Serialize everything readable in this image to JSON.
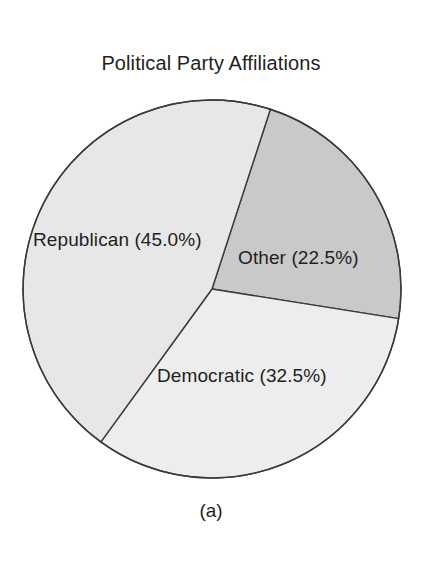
{
  "chart_data": {
    "type": "pie",
    "title": "Political Party Affiliations",
    "caption": "(a)",
    "xlabel": "",
    "ylabel": "",
    "legend": "none",
    "grid": false,
    "start_angle_deg": 72,
    "direction": "clockwise",
    "categories": [
      "Other",
      "Democratic",
      "Republican"
    ],
    "values": [
      22.5,
      32.5,
      45.0
    ],
    "units": "percent",
    "slices": [
      {
        "name": "Other",
        "value": 22.5,
        "label": "Other (22.5%)",
        "color": "#c9c9c9",
        "angle_deg": 81.0,
        "start_deg": -72.0,
        "end_deg": 9.0
      },
      {
        "name": "Democratic",
        "value": 32.5,
        "label": "Democratic (32.5%)",
        "color": "#ededed",
        "angle_deg": 117.0,
        "start_deg": 9.0,
        "end_deg": 126.0
      },
      {
        "name": "Republican",
        "value": 45.0,
        "label": "Republican (45.0%)",
        "color": "#e7e7e7",
        "angle_deg": 162.0,
        "start_deg": 126.0,
        "end_deg": 288.0
      }
    ],
    "geometry": {
      "center_x": 212,
      "center_y": 289,
      "radius": 189
    },
    "style": {
      "background": "#ffffff",
      "stroke": "#3a3a3a",
      "stroke_width": 1.4,
      "text_color": "#231f20"
    }
  }
}
